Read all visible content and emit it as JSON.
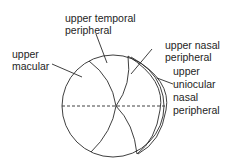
{
  "diagram": {
    "labels": {
      "upper_temporal_peripheral": [
        "upper temporal",
        "peripheral"
      ],
      "upper_macular": [
        "upper",
        "macular"
      ],
      "upper_nasal_peripheral": [
        "upper nasal",
        "peripheral"
      ],
      "upper_uniocular_nasal_peripheral": [
        "upper",
        "uniocular",
        "nasal",
        "peripheral"
      ]
    },
    "colors": {
      "line": "#2a2a2a",
      "text": "#1e1e1e",
      "background": "#ffffff"
    }
  }
}
